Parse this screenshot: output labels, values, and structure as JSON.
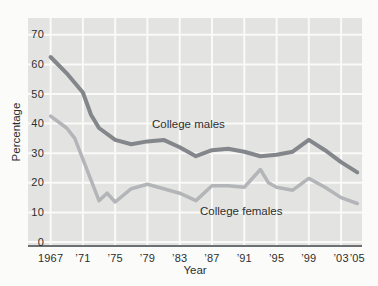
{
  "figure": {
    "background": "#fbfbfa",
    "plot_background": "#e3e3e2",
    "gridline_color": "#fafaf8",
    "axis_color": "#6e7174",
    "text_color": "#2e2e2e"
  },
  "chart_data": {
    "type": "line",
    "title": "",
    "xlabel": "Year",
    "ylabel": "Percentage",
    "grid": true,
    "xlim": [
      1964.2,
      2005.6
    ],
    "ylim": [
      0,
      70
    ],
    "y_ticks": [
      0,
      10,
      20,
      30,
      40,
      50,
      60,
      70
    ],
    "x_tick_years": [
      1967,
      1971,
      1975,
      1979,
      1983,
      1987,
      1991,
      1995,
      1999,
      2003,
      2005
    ],
    "x_tick_labels": [
      "1967",
      "’71",
      "’75",
      "’79",
      "’83",
      "’87",
      "’91",
      "’95",
      "’99",
      "’03",
      "’05"
    ],
    "x_gridline_years": [
      1967,
      1971,
      1975,
      1979,
      1983,
      1987,
      1991,
      1995,
      1999,
      2003
    ],
    "series": [
      {
        "name": "College females",
        "color": "#b3b5b8",
        "stroke_width": 3.5,
        "points": [
          [
            1967,
            42.5
          ],
          [
            1969,
            38.5
          ],
          [
            1970,
            35
          ],
          [
            1973,
            14
          ],
          [
            1974,
            16.5
          ],
          [
            1975,
            13.5
          ],
          [
            1977,
            18
          ],
          [
            1979,
            19.5
          ],
          [
            1981,
            18
          ],
          [
            1983,
            16.5
          ],
          [
            1985,
            14
          ],
          [
            1987,
            19
          ],
          [
            1989,
            19
          ],
          [
            1991,
            18.5
          ],
          [
            1993,
            24.5
          ],
          [
            1994,
            20
          ],
          [
            1995,
            18.5
          ],
          [
            1997,
            17.5
          ],
          [
            1999,
            21.5
          ],
          [
            2001,
            18.5
          ],
          [
            2003,
            15
          ],
          [
            2005,
            13
          ]
        ]
      },
      {
        "name": "College males",
        "color": "#83868a",
        "stroke_width": 4,
        "points": [
          [
            1967,
            62.5
          ],
          [
            1969,
            57
          ],
          [
            1971,
            50.5
          ],
          [
            1972,
            43
          ],
          [
            1973,
            38.5
          ],
          [
            1975,
            34.5
          ],
          [
            1977,
            33
          ],
          [
            1979,
            34
          ],
          [
            1981,
            34.5
          ],
          [
            1983,
            32
          ],
          [
            1985,
            29
          ],
          [
            1987,
            31
          ],
          [
            1989,
            31.5
          ],
          [
            1991,
            30.5
          ],
          [
            1993,
            29
          ],
          [
            1995,
            29.5
          ],
          [
            1997,
            30.5
          ],
          [
            1999,
            34.5
          ],
          [
            2001,
            31
          ],
          [
            2003,
            27
          ],
          [
            2005,
            23.5
          ]
        ]
      }
    ],
    "annotations": [
      {
        "text": "College males",
        "x": 152,
        "y": 118
      },
      {
        "text": "College females",
        "x": 200,
        "y": 205
      }
    ]
  }
}
